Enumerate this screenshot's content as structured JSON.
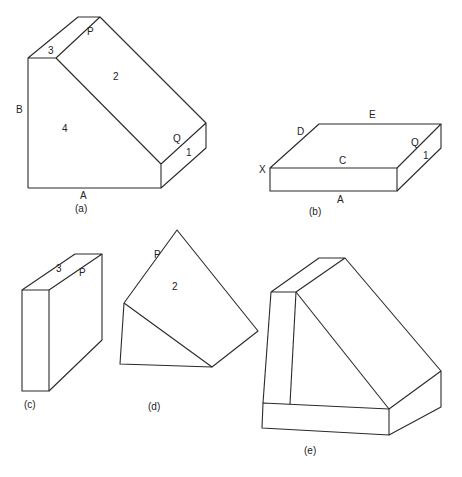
{
  "figure": {
    "panels": [
      {
        "id": "a",
        "caption": "(a)",
        "labels": {
          "p": "P",
          "three": "3",
          "two": "2",
          "b": "B",
          "four": "4",
          "q": "Q",
          "one": "1",
          "a": "A"
        }
      },
      {
        "id": "b",
        "caption": "(b)",
        "labels": {
          "d": "D",
          "e": "E",
          "x": "X",
          "c": "C",
          "q": "Q",
          "one": "1",
          "a": "A"
        }
      },
      {
        "id": "c",
        "caption": "(c)",
        "labels": {
          "three": "3",
          "p": "P"
        }
      },
      {
        "id": "d",
        "caption": "(d)",
        "labels": {
          "p": "P",
          "two": "2"
        }
      },
      {
        "id": "e",
        "caption": "(e)",
        "labels": {}
      }
    ]
  }
}
